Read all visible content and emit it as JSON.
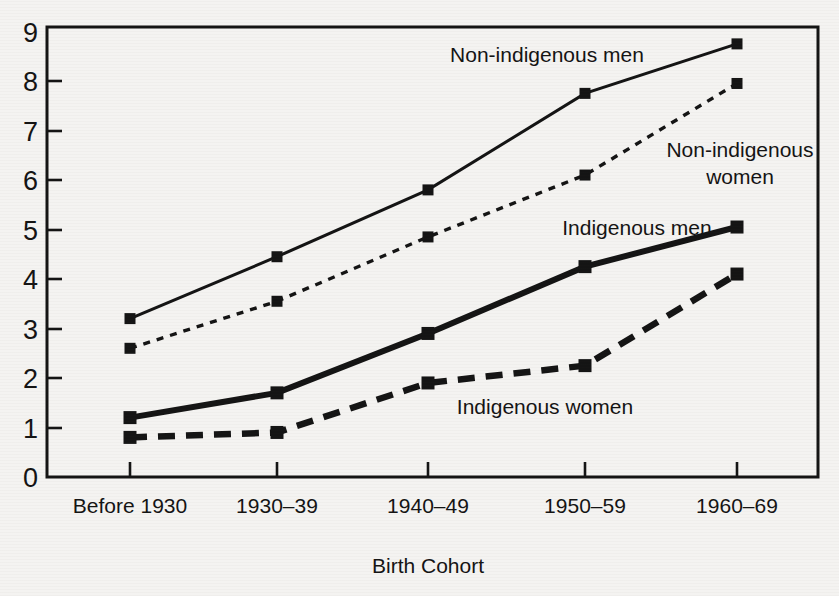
{
  "chart_data": {
    "type": "line",
    "title": "",
    "xlabel": "Birth Cohort",
    "ylabel": "",
    "categories": [
      "Before 1930",
      "1930–39",
      "1940–49",
      "1950–59",
      "1960–69"
    ],
    "yticks": [
      "0",
      "1",
      "2",
      "3",
      "4",
      "5",
      "6",
      "7",
      "8",
      "9"
    ],
    "ylim": [
      0,
      9
    ],
    "grid": false,
    "legend_position": "inline-annotations",
    "series": [
      {
        "name": "Non-indigenous men",
        "label": "Non-indigenous men",
        "linestyle": "solid-thin",
        "marker": "square",
        "color": "#141414",
        "values": [
          3.2,
          4.45,
          5.8,
          7.75,
          8.75
        ]
      },
      {
        "name": "Non-indigenous women",
        "label": "Non-indigenous women",
        "label_line1": "Non-indigenous",
        "label_line2": "women",
        "linestyle": "dotted-fine",
        "marker": "square",
        "color": "#141414",
        "values": [
          2.6,
          3.55,
          4.85,
          6.1,
          7.95
        ]
      },
      {
        "name": "Indigenous men",
        "label": "Indigenous men",
        "linestyle": "solid-thick",
        "marker": "square",
        "color": "#141414",
        "values": [
          1.2,
          1.7,
          2.9,
          4.25,
          5.05
        ]
      },
      {
        "name": "Indigenous women",
        "label": "Indigenous women",
        "linestyle": "dashed-heavy",
        "marker": "square",
        "color": "#141414",
        "values": [
          0.8,
          0.9,
          1.9,
          2.25,
          4.1
        ]
      }
    ]
  },
  "axis": {
    "x_title": "Birth Cohort"
  },
  "colors": {
    "ink": "#141414",
    "paper": "#f4f3f1"
  }
}
